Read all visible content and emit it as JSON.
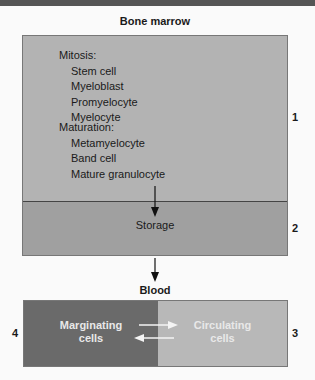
{
  "bone_marrow": {
    "title": "Bone marrow",
    "mitosis": {
      "heading": "Mitosis:",
      "items": [
        "Stem cell",
        "Myeloblast",
        "Promyelocyte",
        "Myelocyte"
      ]
    },
    "maturation": {
      "heading": "Maturation:",
      "items": [
        "Metamyelocyte",
        "Band cell",
        "Mature granulocyte"
      ]
    },
    "storage_label": "Storage",
    "pool_numbers": {
      "upper": "1",
      "storage": "2"
    }
  },
  "blood": {
    "title": "Blood",
    "marginating": {
      "line1": "Marginating",
      "line2": "cells",
      "number": "4"
    },
    "circulating": {
      "line1": "Circulating",
      "line2": "cells",
      "number": "3"
    }
  },
  "colors": {
    "marrow_upper": "#b3b3b3",
    "marrow_storage": "#a0a0a0",
    "marginating": "#6a6a6a",
    "circulating": "#b8b8b8"
  }
}
